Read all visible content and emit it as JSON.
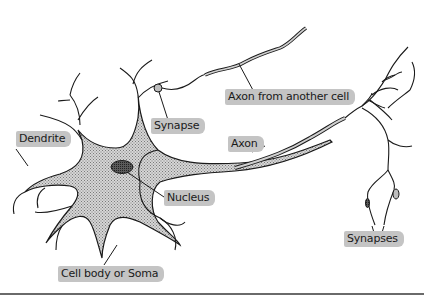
{
  "diagram": {
    "colors": {
      "outline": "#1a1a1a",
      "soma_fill": "#bdbdbd",
      "nucleus_fill": "#555555",
      "label_bg": "#c4c4c4",
      "rule": "#6a6a6a"
    },
    "labels": {
      "dendrite": "Dendrite",
      "synapse": "Synapse",
      "axon_from_another_cell": "Axon from another cell",
      "axon": "Axon",
      "nucleus": "Nucleus",
      "cell_body": "Cell body or Soma",
      "synapses": "Synapses"
    }
  }
}
